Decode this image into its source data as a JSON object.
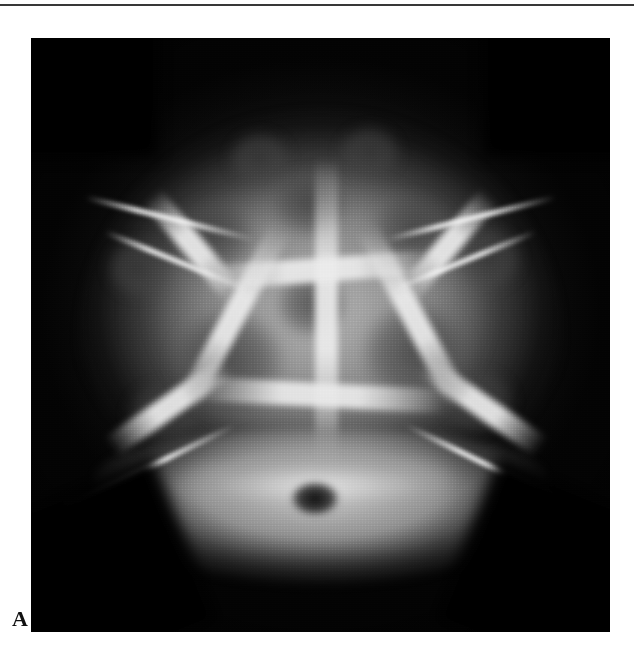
{
  "page": {
    "background_color": "#ffffff",
    "has_top_rule": true,
    "top_rule_color": "#1c1c1c"
  },
  "figure": {
    "panel_label": "A",
    "label_position": "bottom-left",
    "modality": "plain-radiograph",
    "projection": "anteroposterior-skull",
    "image_background_color": "#000000",
    "caption": "",
    "findings_depicted": [
      "multiple confluent rounded lytic lesions of the calvarium",
      "geographic skull / soap-bubble lucency pattern",
      "bright sclerotic septa separating lucent defects",
      "bilateral sphenoid wing bright linear densities",
      "visualized skull base with foramen magnum",
      "mandible and upper cervical structures inferiorly"
    ],
    "panel_bounds": {
      "x": 31,
      "y": 38,
      "width": 579,
      "height": 594
    }
  },
  "radiograph": {
    "lesions": [
      {
        "name": "lesion-left-upper",
        "left": 23,
        "top": 26,
        "width": 17,
        "height": 15
      },
      {
        "name": "lesion-left-mid-outer",
        "left": 12,
        "top": 33,
        "width": 13,
        "height": 12
      },
      {
        "name": "lesion-left-large",
        "left": 22,
        "top": 44,
        "width": 24,
        "height": 22
      },
      {
        "name": "lesion-left-lower",
        "left": 15,
        "top": 57,
        "width": 16,
        "height": 13
      },
      {
        "name": "lesion-midline-upper",
        "left": 40,
        "top": 21,
        "width": 16,
        "height": 14
      },
      {
        "name": "lesion-midline-center",
        "left": 41,
        "top": 38,
        "width": 15,
        "height": 14
      },
      {
        "name": "lesion-right-upper",
        "left": 57,
        "top": 25,
        "width": 18,
        "height": 16
      },
      {
        "name": "lesion-right-outer",
        "left": 72,
        "top": 31,
        "width": 14,
        "height": 13
      },
      {
        "name": "lesion-right-large",
        "left": 55,
        "top": 43,
        "width": 23,
        "height": 21
      },
      {
        "name": "lesion-right-lower",
        "left": 70,
        "top": 55,
        "width": 15,
        "height": 13
      },
      {
        "name": "lesion-vertex-left",
        "left": 33,
        "top": 15,
        "width": 13,
        "height": 11
      },
      {
        "name": "lesion-vertex-right",
        "left": 52,
        "top": 14,
        "width": 13,
        "height": 11
      },
      {
        "name": "lesion-base-left",
        "left": 24,
        "top": 70,
        "width": 14,
        "height": 10
      },
      {
        "name": "lesion-base-right",
        "left": 60,
        "top": 69,
        "width": 14,
        "height": 10
      }
    ],
    "septa": [
      {
        "name": "septum-midline-vertical",
        "left": 49,
        "top": 20,
        "width": 4,
        "height": 52,
        "rotate": 0
      },
      {
        "name": "septum-left-oblique",
        "left": 33,
        "top": 30,
        "width": 4,
        "height": 34,
        "rotate": 28
      },
      {
        "name": "septum-right-oblique",
        "left": 64,
        "top": 30,
        "width": 4,
        "height": 34,
        "rotate": -28
      },
      {
        "name": "septum-left-upper-arc",
        "left": 26,
        "top": 24,
        "width": 4,
        "height": 22,
        "rotate": -40
      },
      {
        "name": "septum-right-upper-arc",
        "left": 70,
        "top": 24,
        "width": 4,
        "height": 22,
        "rotate": 40
      },
      {
        "name": "septum-horizontal-upper",
        "left": 30,
        "top": 37,
        "width": 40,
        "height": 4,
        "rotate": -4
      },
      {
        "name": "septum-horizontal-lower",
        "left": 28,
        "top": 58,
        "width": 44,
        "height": 4,
        "rotate": 3
      },
      {
        "name": "septum-left-lower-oblique",
        "left": 22,
        "top": 50,
        "width": 4,
        "height": 24,
        "rotate": 55
      },
      {
        "name": "septum-right-lower-oblique",
        "left": 76,
        "top": 50,
        "width": 4,
        "height": 24,
        "rotate": -55
      }
    ],
    "spicules": [
      {
        "name": "spicule-left-sphenoid",
        "left": 9,
        "top": 30,
        "width": 30,
        "rotate": 14
      },
      {
        "name": "spicule-right-sphenoid",
        "left": 61,
        "top": 30,
        "width": 30,
        "rotate": -14
      },
      {
        "name": "spicule-left-orbital",
        "left": 12,
        "top": 37,
        "width": 26,
        "rotate": 22
      },
      {
        "name": "spicule-right-orbital",
        "left": 62,
        "top": 37,
        "width": 26,
        "rotate": -22
      },
      {
        "name": "spicule-right-lower-band",
        "left": 63,
        "top": 72,
        "width": 34,
        "rotate": 26
      },
      {
        "name": "spicule-left-lower-band",
        "left": 3,
        "top": 72,
        "width": 34,
        "rotate": -26
      }
    ],
    "corner_shadows": [
      {
        "name": "shadow-bottom-left",
        "left": -8,
        "top": 76,
        "width": 36,
        "height": 30,
        "rotate": -22
      },
      {
        "name": "shadow-bottom-right",
        "left": 74,
        "top": 76,
        "width": 36,
        "height": 30,
        "rotate": 22
      },
      {
        "name": "shadow-top-left",
        "left": -12,
        "top": -6,
        "width": 34,
        "height": 26,
        "rotate": 0
      },
      {
        "name": "shadow-top-right",
        "left": 78,
        "top": -6,
        "width": 34,
        "height": 26,
        "rotate": 0
      }
    ],
    "foramen": {
      "name": "foramen-magnum",
      "left": 44,
      "top": 74,
      "width": 10,
      "height": 7
    }
  }
}
